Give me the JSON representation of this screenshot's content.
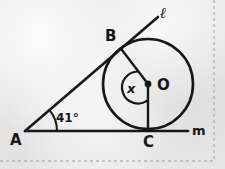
{
  "figure": {
    "type": "geometry-diagram",
    "background_color": "#e9e9e9",
    "ink_color": "#171717",
    "border": {
      "style": "dashed",
      "edges": [
        "right",
        "bottom"
      ],
      "color": "#9a9a9a"
    },
    "points": [
      {
        "name": "A",
        "label": "A",
        "x": 25,
        "y": 131,
        "label_x": 10,
        "label_y": 133
      },
      {
        "name": "B",
        "label": "B",
        "x": 122,
        "y": 50,
        "label_x": 105,
        "label_y": 29
      },
      {
        "name": "C",
        "label": "C",
        "x": 148,
        "y": 130,
        "label_x": 143,
        "label_y": 135
      },
      {
        "name": "O",
        "label": "O",
        "x": 148,
        "y": 84,
        "label_x": 157,
        "label_y": 78
      }
    ],
    "lines": [
      {
        "name": "line-l",
        "label": "ℓ",
        "label_x": 160,
        "label_y": 6,
        "from": [
          25,
          131
        ],
        "to": [
          158,
          17
        ]
      },
      {
        "name": "line-m",
        "label": "m",
        "label_x": 192,
        "label_y": 124,
        "from": [
          25,
          131
        ],
        "to": [
          188,
          131
        ]
      }
    ],
    "circle": {
      "cx": 148,
      "cy": 84,
      "r": 45
    },
    "radii": [
      {
        "name": "radius-OB",
        "from": [
          148,
          84
        ],
        "to": [
          122,
          50
        ]
      },
      {
        "name": "radius-OC",
        "from": [
          148,
          84
        ],
        "to": [
          148,
          130
        ]
      }
    ],
    "angles": [
      {
        "name": "angle-A",
        "vertex": "A",
        "value": "41°",
        "label_x": 56,
        "label_y": 112
      },
      {
        "name": "angle-BOC",
        "vertex": "O",
        "value": "x",
        "label_x": 127,
        "label_y": 82
      }
    ]
  }
}
